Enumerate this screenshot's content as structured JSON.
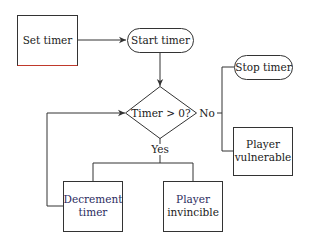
{
  "diagram": {
    "type": "flowchart",
    "nodes": {
      "set_timer": {
        "label": "Set timer",
        "shape": "rectangle"
      },
      "start_timer": {
        "label": "Start timer",
        "shape": "terminator"
      },
      "decision": {
        "label": "Timer > 0?",
        "shape": "diamond"
      },
      "stop_timer": {
        "label": "Stop timer",
        "shape": "terminator"
      },
      "player_vulnerable": {
        "line1": "Player",
        "line2": "vulnerable",
        "shape": "rectangle"
      },
      "decrement_timer": {
        "line1": "Decrement",
        "line2": "timer",
        "shape": "rectangle"
      },
      "player_invincible": {
        "line1": "Player",
        "line2": "invincible",
        "shape": "rectangle"
      }
    },
    "edge_labels": {
      "no": "No",
      "yes": "Yes"
    },
    "edges": [
      {
        "from": "Set timer",
        "to": "Start timer"
      },
      {
        "from": "Start timer",
        "to": "Timer > 0?"
      },
      {
        "from": "Timer > 0?",
        "to": "Stop timer",
        "label": "No"
      },
      {
        "from": "Timer > 0?",
        "to": "Player vulnerable",
        "label": "No"
      },
      {
        "from": "Timer > 0?",
        "to": "Decrement timer",
        "label": "Yes"
      },
      {
        "from": "Timer > 0?",
        "to": "Player invincible",
        "label": "Yes"
      },
      {
        "from": "Decrement timer",
        "to": "Timer > 0?"
      }
    ]
  }
}
